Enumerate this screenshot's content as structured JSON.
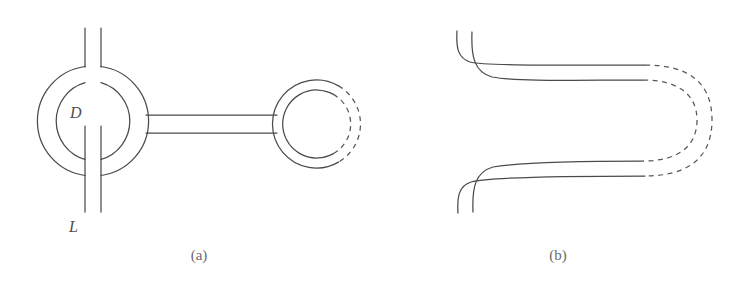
{
  "figure": {
    "width": 736,
    "height": 293,
    "background": "#ffffff",
    "stroke_color": "#4a4a4a",
    "dashed_stroke_color": "#585858",
    "label_color": "#4e4e4e",
    "caption_color": "#6a6a6a"
  },
  "panels": [
    {
      "id": "panel-a",
      "caption": "(a)",
      "caption_x": 199,
      "caption_y": 260,
      "description": "Annular ring (torus cross-section) with diameter label D and a pair of parallel leg lines labelled L, joined by a straight double-line tube to a second annular ring whose right half is drawn dashed.",
      "labels": [
        {
          "name": "diameter-label",
          "text": "D",
          "x": 70,
          "y": 118
        },
        {
          "name": "length-label",
          "text": "L",
          "x": 69,
          "y": 232
        }
      ],
      "left_ring": {
        "center_x": 92,
        "center_y": 121,
        "outer_radius": 55,
        "inner_radius": 40
      },
      "right_ring": {
        "center_x": 316,
        "center_y": 124,
        "outer_radius": 44,
        "inner_radius": 34,
        "dashed_half": "right"
      },
      "tube": {
        "x_start": 146,
        "x_end": 277,
        "top_y": 115,
        "bottom_y": 133
      },
      "top_legs": {
        "x_left": 85,
        "x_right": 101,
        "y_top": 28,
        "y_bottom": 67
      },
      "bottom_legs": {
        "x_left": 85,
        "x_right": 101,
        "y_top": 125,
        "y_bottom": 212
      }
    },
    {
      "id": "panel-b",
      "caption": "(b)",
      "caption_x": 548,
      "caption_y": 260,
      "description": "Two pairs of parallel curved lines entering from the upper-left and lower-left, bending to horizontal and terminating at the right where dashed hairpin U-turn arcs close the loop.",
      "labels": [],
      "upper_band": {
        "start_x_outer": 457,
        "start_y": 31,
        "start_x_inner": 472,
        "horizontal_y_outer": 65,
        "horizontal_y_inner": 80,
        "solid_end_x": 645
      },
      "lower_band": {
        "start_x_outer": 458,
        "start_y": 213,
        "start_x_inner": 473,
        "horizontal_y_outer": 161,
        "horizontal_y_inner": 175,
        "solid_end_x": 645
      },
      "dashed_turns": {
        "outer_apex_x": 712,
        "inner_apex_x": 697
      }
    }
  ]
}
